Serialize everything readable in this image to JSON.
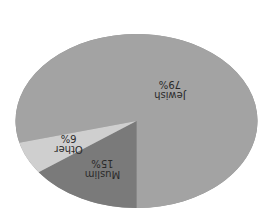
{
  "chart_data": {
    "type": "pie",
    "title": "",
    "orientation_note": "rendered upside down (rotated 180 degrees), 3D tilted pie",
    "slices": [
      {
        "label": "Jewish",
        "value": 79,
        "display": "79%",
        "color": "#a3a3a3"
      },
      {
        "label": "Muslim",
        "value": 15,
        "display": "15%",
        "color": "#7a7a7a"
      },
      {
        "label": "Other",
        "value": 6,
        "display": "6%",
        "color": "#cfcfcf"
      }
    ],
    "rim_color": "#8e8e8e",
    "legend": "none"
  }
}
